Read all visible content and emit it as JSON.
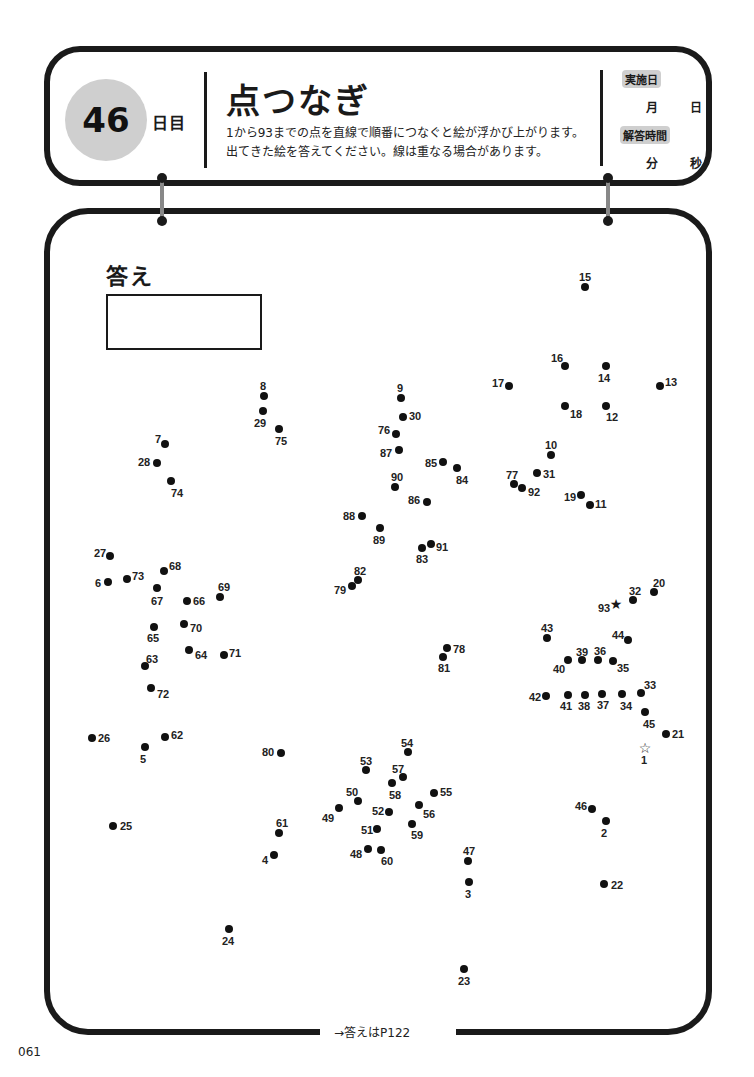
{
  "header": {
    "day_number": "46",
    "day_suffix": "日目",
    "title": "点つなぎ",
    "description_line1": "1から93までの点を直線で順番につなぐと絵が浮かび上がります。",
    "description_line2": "出てきた絵を答えてください。線は重なる場合があります。",
    "date_tag": "実施日",
    "month_unit": "月",
    "day_unit": "日",
    "time_tag": "解答時間",
    "minute_unit": "分",
    "second_unit": "秒"
  },
  "answer": {
    "label": "答え"
  },
  "footer": {
    "answer_ref": "→答えはP122",
    "page_number": "061"
  },
  "dots": [
    {
      "n": "1",
      "x": 645,
      "y": 748,
      "lx": 641,
      "ly": 754,
      "type": "start"
    },
    {
      "n": "2",
      "x": 606,
      "y": 821,
      "lx": 601,
      "ly": 827
    },
    {
      "n": "3",
      "x": 469,
      "y": 882,
      "lx": 465,
      "ly": 888
    },
    {
      "n": "4",
      "x": 274,
      "y": 855,
      "lx": 262,
      "ly": 854
    },
    {
      "n": "5",
      "x": 145,
      "y": 747,
      "lx": 140,
      "ly": 753
    },
    {
      "n": "6",
      "x": 108,
      "y": 582,
      "lx": 95,
      "ly": 577
    },
    {
      "n": "7",
      "x": 165,
      "y": 444,
      "lx": 155,
      "ly": 433
    },
    {
      "n": "8",
      "x": 264,
      "y": 396,
      "lx": 260,
      "ly": 380
    },
    {
      "n": "9",
      "x": 401,
      "y": 398,
      "lx": 397,
      "ly": 382
    },
    {
      "n": "10",
      "x": 551,
      "y": 455,
      "lx": 545,
      "ly": 439
    },
    {
      "n": "11",
      "x": 590,
      "y": 505,
      "lx": 595,
      "ly": 498
    },
    {
      "n": "12",
      "x": 606,
      "y": 406,
      "lx": 606,
      "ly": 411
    },
    {
      "n": "13",
      "x": 660,
      "y": 386,
      "lx": 665,
      "ly": 376
    },
    {
      "n": "14",
      "x": 606,
      "y": 366,
      "lx": 598,
      "ly": 372
    },
    {
      "n": "15",
      "x": 585,
      "y": 287,
      "lx": 579,
      "ly": 271
    },
    {
      "n": "16",
      "x": 565,
      "y": 366,
      "lx": 551,
      "ly": 352
    },
    {
      "n": "17",
      "x": 509,
      "y": 386,
      "lx": 492,
      "ly": 377
    },
    {
      "n": "18",
      "x": 565,
      "y": 406,
      "lx": 570,
      "ly": 408
    },
    {
      "n": "19",
      "x": 581,
      "y": 495,
      "lx": 564,
      "ly": 491
    },
    {
      "n": "20",
      "x": 654,
      "y": 592,
      "lx": 653,
      "ly": 577
    },
    {
      "n": "21",
      "x": 666,
      "y": 734,
      "lx": 672,
      "ly": 728
    },
    {
      "n": "22",
      "x": 604,
      "y": 884,
      "lx": 611,
      "ly": 879
    },
    {
      "n": "23",
      "x": 464,
      "y": 969,
      "lx": 458,
      "ly": 975
    },
    {
      "n": "24",
      "x": 229,
      "y": 929,
      "lx": 222,
      "ly": 935
    },
    {
      "n": "25",
      "x": 113,
      "y": 826,
      "lx": 120,
      "ly": 820
    },
    {
      "n": "26",
      "x": 92,
      "y": 738,
      "lx": 98,
      "ly": 732
    },
    {
      "n": "27",
      "x": 110,
      "y": 556,
      "lx": 94,
      "ly": 547
    },
    {
      "n": "28",
      "x": 157,
      "y": 463,
      "lx": 138,
      "ly": 456
    },
    {
      "n": "29",
      "x": 263,
      "y": 411,
      "lx": 254,
      "ly": 417
    },
    {
      "n": "30",
      "x": 403,
      "y": 417,
      "lx": 409,
      "ly": 410
    },
    {
      "n": "31",
      "x": 537,
      "y": 473,
      "lx": 543,
      "ly": 468
    },
    {
      "n": "32",
      "x": 633,
      "y": 600,
      "lx": 629,
      "ly": 585
    },
    {
      "n": "33",
      "x": 641,
      "y": 693,
      "lx": 644,
      "ly": 679
    },
    {
      "n": "34",
      "x": 622,
      "y": 694,
      "lx": 620,
      "ly": 700
    },
    {
      "n": "35",
      "x": 613,
      "y": 661,
      "lx": 617,
      "ly": 662
    },
    {
      "n": "36",
      "x": 598,
      "y": 660,
      "lx": 594,
      "ly": 645
    },
    {
      "n": "37",
      "x": 602,
      "y": 694,
      "lx": 597,
      "ly": 699
    },
    {
      "n": "38",
      "x": 585,
      "y": 695,
      "lx": 578,
      "ly": 700
    },
    {
      "n": "39",
      "x": 582,
      "y": 660,
      "lx": 576,
      "ly": 646
    },
    {
      "n": "40",
      "x": 568,
      "y": 660,
      "lx": 553,
      "ly": 663
    },
    {
      "n": "41",
      "x": 568,
      "y": 695,
      "lx": 560,
      "ly": 700
    },
    {
      "n": "42",
      "x": 546,
      "y": 696,
      "lx": 529,
      "ly": 691
    },
    {
      "n": "43",
      "x": 547,
      "y": 638,
      "lx": 541,
      "ly": 622
    },
    {
      "n": "44",
      "x": 628,
      "y": 640,
      "lx": 612,
      "ly": 629
    },
    {
      "n": "45",
      "x": 645,
      "y": 712,
      "lx": 643,
      "ly": 718
    },
    {
      "n": "46",
      "x": 592,
      "y": 809,
      "lx": 575,
      "ly": 800
    },
    {
      "n": "47",
      "x": 468,
      "y": 861,
      "lx": 463,
      "ly": 845
    },
    {
      "n": "48",
      "x": 368,
      "y": 849,
      "lx": 350,
      "ly": 848
    },
    {
      "n": "49",
      "x": 339,
      "y": 808,
      "lx": 322,
      "ly": 812
    },
    {
      "n": "50",
      "x": 358,
      "y": 801,
      "lx": 346,
      "ly": 786
    },
    {
      "n": "51",
      "x": 377,
      "y": 829,
      "lx": 361,
      "ly": 824
    },
    {
      "n": "52",
      "x": 389,
      "y": 812,
      "lx": 372,
      "ly": 805
    },
    {
      "n": "53",
      "x": 366,
      "y": 770,
      "lx": 360,
      "ly": 755
    },
    {
      "n": "54",
      "x": 408,
      "y": 752,
      "lx": 401,
      "ly": 737
    },
    {
      "n": "55",
      "x": 434,
      "y": 793,
      "lx": 440,
      "ly": 786
    },
    {
      "n": "56",
      "x": 419,
      "y": 805,
      "lx": 423,
      "ly": 808
    },
    {
      "n": "57",
      "x": 403,
      "y": 777,
      "lx": 392,
      "ly": 763
    },
    {
      "n": "58",
      "x": 392,
      "y": 783,
      "lx": 389,
      "ly": 789
    },
    {
      "n": "59",
      "x": 412,
      "y": 824,
      "lx": 411,
      "ly": 829
    },
    {
      "n": "60",
      "x": 381,
      "y": 850,
      "lx": 381,
      "ly": 855
    },
    {
      "n": "61",
      "x": 279,
      "y": 833,
      "lx": 276,
      "ly": 817
    },
    {
      "n": "62",
      "x": 165,
      "y": 737,
      "lx": 171,
      "ly": 729
    },
    {
      "n": "63",
      "x": 145,
      "y": 666,
      "lx": 146,
      "ly": 653
    },
    {
      "n": "64",
      "x": 189,
      "y": 650,
      "lx": 195,
      "ly": 649
    },
    {
      "n": "65",
      "x": 154,
      "y": 627,
      "lx": 147,
      "ly": 632
    },
    {
      "n": "66",
      "x": 187,
      "y": 601,
      "lx": 193,
      "ly": 595
    },
    {
      "n": "67",
      "x": 157,
      "y": 588,
      "lx": 151,
      "ly": 595
    },
    {
      "n": "68",
      "x": 164,
      "y": 571,
      "lx": 169,
      "ly": 560
    },
    {
      "n": "69",
      "x": 220,
      "y": 597,
      "lx": 218,
      "ly": 581
    },
    {
      "n": "70",
      "x": 184,
      "y": 624,
      "lx": 190,
      "ly": 622
    },
    {
      "n": "71",
      "x": 224,
      "y": 655,
      "lx": 229,
      "ly": 647
    },
    {
      "n": "72",
      "x": 151,
      "y": 688,
      "lx": 157,
      "ly": 688
    },
    {
      "n": "73",
      "x": 127,
      "y": 579,
      "lx": 132,
      "ly": 570
    },
    {
      "n": "74",
      "x": 171,
      "y": 481,
      "lx": 171,
      "ly": 487
    },
    {
      "n": "75",
      "x": 279,
      "y": 429,
      "lx": 275,
      "ly": 435
    },
    {
      "n": "76",
      "x": 396,
      "y": 434,
      "lx": 378,
      "ly": 424
    },
    {
      "n": "77",
      "x": 514,
      "y": 484,
      "lx": 506,
      "ly": 469
    },
    {
      "n": "78",
      "x": 447,
      "y": 648,
      "lx": 453,
      "ly": 643
    },
    {
      "n": "79",
      "x": 352,
      "y": 586,
      "lx": 334,
      "ly": 584
    },
    {
      "n": "80",
      "x": 281,
      "y": 753,
      "lx": 262,
      "ly": 746
    },
    {
      "n": "81",
      "x": 443,
      "y": 657,
      "lx": 438,
      "ly": 662
    },
    {
      "n": "82",
      "x": 358,
      "y": 580,
      "lx": 354,
      "ly": 565
    },
    {
      "n": "83",
      "x": 422,
      "y": 548,
      "lx": 416,
      "ly": 553
    },
    {
      "n": "84",
      "x": 457,
      "y": 468,
      "lx": 456,
      "ly": 474
    },
    {
      "n": "85",
      "x": 443,
      "y": 462,
      "lx": 425,
      "ly": 457
    },
    {
      "n": "86",
      "x": 427,
      "y": 502,
      "lx": 408,
      "ly": 494
    },
    {
      "n": "87",
      "x": 399,
      "y": 450,
      "lx": 380,
      "ly": 447
    },
    {
      "n": "88",
      "x": 362,
      "y": 516,
      "lx": 343,
      "ly": 510
    },
    {
      "n": "89",
      "x": 380,
      "y": 528,
      "lx": 373,
      "ly": 534
    },
    {
      "n": "90",
      "x": 395,
      "y": 487,
      "lx": 391,
      "ly": 471
    },
    {
      "n": "91",
      "x": 431,
      "y": 544,
      "lx": 436,
      "ly": 541
    },
    {
      "n": "92",
      "x": 522,
      "y": 488,
      "lx": 528,
      "ly": 486
    },
    {
      "n": "93",
      "x": 616,
      "y": 604,
      "lx": 598,
      "ly": 602,
      "type": "end"
    }
  ]
}
